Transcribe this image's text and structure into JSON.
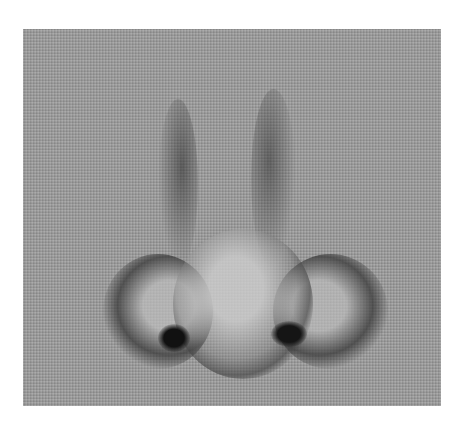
{
  "image": {
    "subject": "Pencil drawing of a human nose, front view",
    "medium": "graphite on textured gray canvas",
    "colors": {
      "background": "#ffffff",
      "canvas": "#9a9a9a",
      "shadow": "#3a3a3a",
      "nostril": "#141414",
      "highlight": "#b8b8b8"
    }
  }
}
